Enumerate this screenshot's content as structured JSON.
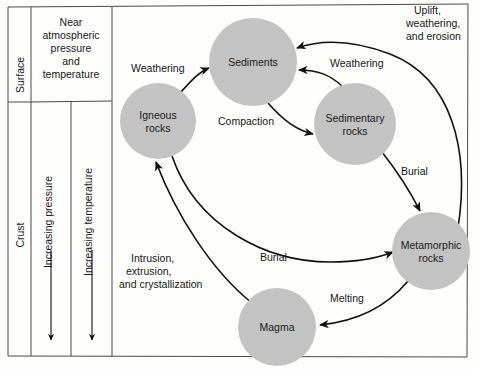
{
  "diagram": {
    "colors": {
      "node_fill": "#c3c3c3",
      "frame_stroke": "#4a4a4a",
      "arrow_stroke": "#111111",
      "background": "#fdfdfc",
      "text": "#181818"
    },
    "panels": [
      {
        "name": "surface",
        "label": "Surface"
      },
      {
        "name": "crust",
        "label": "Crust"
      },
      {
        "name": "near-atmospheric",
        "lines": [
          "Near",
          "atmospheric",
          "pressure",
          "and",
          "temperature"
        ]
      }
    ],
    "axes": [
      {
        "name": "pressure",
        "label": "Increasing pressure",
        "direction": "down"
      },
      {
        "name": "temperature",
        "label": "Increasing temperature",
        "direction": "down"
      }
    ],
    "nodes": [
      {
        "id": "igneous",
        "lines": [
          "Igneous",
          "rocks"
        ],
        "cx": 158,
        "cy": 121,
        "r": 38
      },
      {
        "id": "sediments",
        "lines": [
          "Sediments"
        ],
        "cx": 253,
        "cy": 62,
        "r": 44
      },
      {
        "id": "sedimentary",
        "lines": [
          "Sedimentary",
          "rocks"
        ],
        "cx": 355,
        "cy": 124,
        "r": 41
      },
      {
        "id": "metamorphic",
        "lines": [
          "Metamorphic",
          "rocks"
        ],
        "cx": 431,
        "cy": 251,
        "r": 39
      },
      {
        "id": "magma",
        "lines": [
          "Magma"
        ],
        "cx": 277,
        "cy": 327,
        "r": 39
      }
    ],
    "edges": [
      {
        "id": "weathering-igneous",
        "label": "Weathering",
        "from": "igneous",
        "to": "sediments"
      },
      {
        "id": "weathering-sedimentary",
        "label": "Weathering",
        "from": "sedimentary",
        "to": "sediments"
      },
      {
        "id": "compaction",
        "label": "Compaction",
        "from": "sediments",
        "to": "sedimentary"
      },
      {
        "id": "uplift",
        "lines": [
          "Uplift,",
          "weathering,",
          "and erosion"
        ],
        "from": "metamorphic",
        "to": "sediments"
      },
      {
        "id": "burial-sedimentary",
        "label": "Burial",
        "from": "sedimentary",
        "to": "metamorphic"
      },
      {
        "id": "burial-igneous",
        "label": "Burial",
        "from": "igneous",
        "to": "metamorphic"
      },
      {
        "id": "melting",
        "label": "Melting",
        "from": "metamorphic",
        "to": "magma"
      },
      {
        "id": "intrusion",
        "lines": [
          "Intrusion,",
          "extrusion,",
          "and crystallization"
        ],
        "from": "magma",
        "to": "igneous"
      }
    ]
  }
}
